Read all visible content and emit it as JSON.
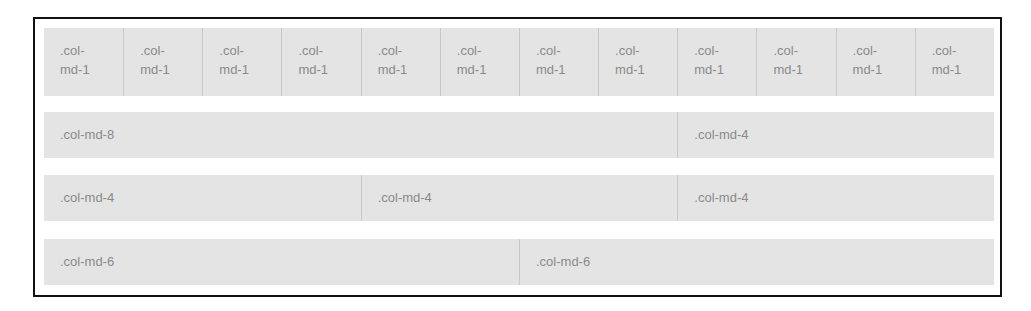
{
  "rows": [
    {
      "name": "row-twelve-ones",
      "columns": [
        {
          "label": ".col-md-1",
          "span": 1
        },
        {
          "label": ".col-md-1",
          "span": 1
        },
        {
          "label": ".col-md-1",
          "span": 1
        },
        {
          "label": ".col-md-1",
          "span": 1
        },
        {
          "label": ".col-md-1",
          "span": 1
        },
        {
          "label": ".col-md-1",
          "span": 1
        },
        {
          "label": ".col-md-1",
          "span": 1
        },
        {
          "label": ".col-md-1",
          "span": 1
        },
        {
          "label": ".col-md-1",
          "span": 1
        },
        {
          "label": ".col-md-1",
          "span": 1
        },
        {
          "label": ".col-md-1",
          "span": 1
        },
        {
          "label": ".col-md-1",
          "span": 1
        }
      ]
    },
    {
      "name": "row-eight-four",
      "columns": [
        {
          "label": ".col-md-8",
          "span": 8
        },
        {
          "label": ".col-md-4",
          "span": 4
        }
      ]
    },
    {
      "name": "row-four-four-four",
      "columns": [
        {
          "label": ".col-md-4",
          "span": 4
        },
        {
          "label": ".col-md-4",
          "span": 4
        },
        {
          "label": ".col-md-4",
          "span": 4
        }
      ]
    },
    {
      "name": "row-six-six",
      "columns": [
        {
          "label": ".col-md-6",
          "span": 6
        },
        {
          "label": ".col-md-6",
          "span": 6
        }
      ]
    }
  ],
  "colors": {
    "frame_border": "#111111",
    "cell_background": "#e4e4e4",
    "cell_divider": "#c8c8c8",
    "label_text": "#8a8a8a"
  }
}
